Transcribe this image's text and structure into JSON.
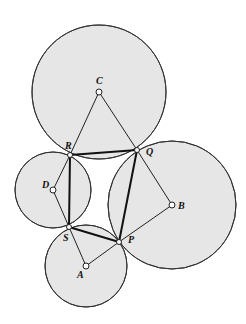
{
  "diagram": {
    "title": "",
    "circles": [
      {
        "id": "circle-c",
        "center": "C",
        "cx": 99,
        "cy": 92,
        "r": 67
      },
      {
        "id": "circle-b",
        "center": "B",
        "cx": 172,
        "cy": 205,
        "r": 64
      },
      {
        "id": "circle-d",
        "center": "D",
        "cx": 53,
        "cy": 190,
        "r": 38
      },
      {
        "id": "circle-a",
        "center": "A",
        "cx": 86,
        "cy": 266,
        "r": 41
      }
    ],
    "points": {
      "C": {
        "label": "C",
        "x": 99,
        "y": 92
      },
      "R": {
        "label": "R",
        "x": 70,
        "y": 155
      },
      "Q": {
        "label": "Q",
        "x": 137,
        "y": 150
      },
      "B": {
        "label": "B",
        "x": 172,
        "y": 205
      },
      "D": {
        "label": "D",
        "x": 53,
        "y": 190
      },
      "S": {
        "label": "S",
        "x": 69,
        "y": 227
      },
      "P": {
        "label": "P",
        "x": 119,
        "y": 242
      },
      "A": {
        "label": "A",
        "x": 86,
        "y": 266
      }
    },
    "thin_segments": [
      [
        "C",
        "R"
      ],
      [
        "C",
        "Q"
      ],
      [
        "Q",
        "B"
      ],
      [
        "B",
        "P"
      ],
      [
        "D",
        "R"
      ],
      [
        "D",
        "S"
      ],
      [
        "S",
        "A"
      ],
      [
        "A",
        "P"
      ]
    ],
    "thick_segments": [
      [
        "R",
        "Q"
      ],
      [
        "Q",
        "P"
      ],
      [
        "P",
        "S"
      ],
      [
        "S",
        "R"
      ]
    ]
  }
}
